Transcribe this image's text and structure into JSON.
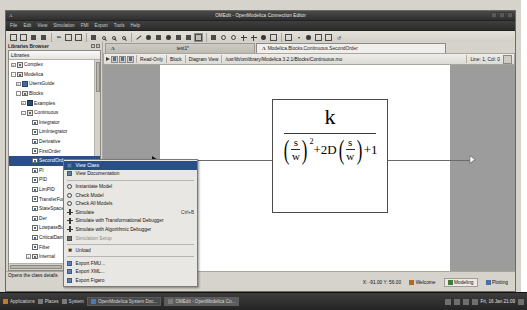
{
  "window": {
    "title": "OMEdit - OpenModelica Connection Editor",
    "app_icon": "A",
    "menus": [
      "File",
      "Edit",
      "View",
      "Simulation",
      "FMI",
      "Export",
      "Tools",
      "Help"
    ]
  },
  "toolbar": {
    "buttons": [
      {
        "name": "new-modelica-class",
        "glyph": "new"
      },
      {
        "name": "open-model",
        "glyph": "open"
      },
      {
        "name": "save",
        "glyph": "save"
      },
      {
        "name": "save-as",
        "glyph": "saveas"
      },
      {
        "name": "cut",
        "glyph": "cut"
      },
      {
        "name": "copy",
        "glyph": "copy"
      },
      {
        "name": "paste",
        "glyph": "paste"
      },
      {
        "name": "grid-lines",
        "glyph": "grid"
      },
      {
        "name": "zoom-reset",
        "glyph": "zoom"
      },
      {
        "name": "zoom-in",
        "glyph": "zoomin"
      },
      {
        "name": "zoom-out",
        "glyph": "zoomout"
      },
      {
        "name": "line-shape",
        "glyph": "line"
      },
      {
        "name": "polygon-shape",
        "glyph": "polygon"
      },
      {
        "name": "rectangle-shape",
        "glyph": "rect"
      },
      {
        "name": "ellipse-shape",
        "glyph": "ellipse"
      },
      {
        "name": "text-shape",
        "glyph": "text"
      },
      {
        "name": "bitmap-shape",
        "glyph": "bitmap"
      },
      {
        "name": "connect-mode",
        "glyph": "connect"
      },
      {
        "name": "check-model",
        "glyph": "check"
      },
      {
        "name": "instantiate-model",
        "glyph": "instantiate"
      },
      {
        "name": "simulate",
        "glyph": "simulate"
      },
      {
        "name": "simulate-transformational",
        "glyph": "simtrans"
      },
      {
        "name": "simulate-algorithmic",
        "glyph": "simalgo"
      },
      {
        "name": "simulation-setup",
        "glyph": "setup"
      },
      {
        "name": "new-plot-window",
        "glyph": "plot"
      },
      {
        "name": "plot-dropdown",
        "glyph": "dropdown"
      },
      {
        "name": "clear-plot",
        "glyph": "clear"
      },
      {
        "name": "grid-toggle",
        "glyph": "gridtoggle"
      },
      {
        "name": "log-view",
        "glyph": "log"
      },
      {
        "name": "rotate",
        "glyph": "rotate"
      }
    ]
  },
  "libraries_browser": {
    "dock_title": "Libraries Browser",
    "column_header": "Libraries",
    "tree": [
      {
        "label": "Complex",
        "depth": 0,
        "expander": "+",
        "icon": "pkg",
        "selected": false
      },
      {
        "label": "Modelica",
        "depth": 0,
        "expander": "-",
        "icon": "pkg",
        "selected": false
      },
      {
        "label": "UsersGuide",
        "depth": 1,
        "expander": "+",
        "icon": "blue",
        "selected": false
      },
      {
        "label": "Blocks",
        "depth": 1,
        "expander": "-",
        "icon": "pkg",
        "selected": false
      },
      {
        "label": "Examples",
        "depth": 2,
        "expander": "+",
        "icon": "mdl",
        "selected": false
      },
      {
        "label": "Continuous",
        "depth": 2,
        "expander": "-",
        "icon": "pkg",
        "selected": false
      },
      {
        "label": "Integrator",
        "depth": 3,
        "expander": "",
        "icon": "blk",
        "selected": false
      },
      {
        "label": "LimIntegrator",
        "depth": 3,
        "expander": "",
        "icon": "blk",
        "selected": false
      },
      {
        "label": "Derivative",
        "depth": 3,
        "expander": "",
        "icon": "blk",
        "selected": false
      },
      {
        "label": "FirstOrder",
        "depth": 3,
        "expander": "",
        "icon": "blk",
        "selected": false
      },
      {
        "label": "SecondOrder",
        "depth": 3,
        "expander": "",
        "icon": "blk",
        "selected": true
      },
      {
        "label": "PI",
        "depth": 3,
        "expander": "",
        "icon": "blk",
        "selected": false
      },
      {
        "label": "PID",
        "depth": 3,
        "expander": "",
        "icon": "blk",
        "selected": false
      },
      {
        "label": "LimPID",
        "depth": 3,
        "expander": "",
        "icon": "blk",
        "selected": false
      },
      {
        "label": "TransferFunction",
        "depth": 3,
        "expander": "",
        "icon": "blk",
        "selected": false
      },
      {
        "label": "StateSpace",
        "depth": 3,
        "expander": "",
        "icon": "blk",
        "selected": false
      },
      {
        "label": "Der",
        "depth": 3,
        "expander": "",
        "icon": "blk",
        "selected": false
      },
      {
        "label": "LowpassButterworth",
        "depth": 3,
        "expander": "",
        "icon": "blk",
        "selected": false
      },
      {
        "label": "CriticalDamping",
        "depth": 3,
        "expander": "",
        "icon": "blk",
        "selected": false
      },
      {
        "label": "Filter",
        "depth": 3,
        "expander": "",
        "icon": "blk",
        "selected": false
      },
      {
        "label": "Internal",
        "depth": 3,
        "expander": "+",
        "icon": "pkg",
        "selected": false
      },
      {
        "label": "Discrete",
        "depth": 2,
        "expander": "+",
        "icon": "pkg",
        "selected": false
      },
      {
        "label": "Interaction",
        "depth": 2,
        "expander": "+",
        "icon": "pkg",
        "selected": false
      },
      {
        "label": "Interfaces",
        "depth": 2,
        "expander": "+",
        "icon": "dk",
        "selected": false
      },
      {
        "label": "Logical",
        "depth": 2,
        "expander": "+",
        "icon": "pkg",
        "selected": false
      },
      {
        "label": "Math",
        "depth": 2,
        "expander": "+",
        "icon": "pkg",
        "selected": false
      }
    ]
  },
  "context_menu": {
    "items": [
      {
        "label": "View Class",
        "icon": "view-class-icon",
        "accel": "",
        "highlighted": true,
        "disabled": false,
        "separator_after": false
      },
      {
        "label": "View Documentation",
        "icon": "documentation-icon",
        "accel": "",
        "highlighted": false,
        "disabled": false,
        "separator_after": true
      },
      {
        "label": "Instantiate Model",
        "icon": "instantiate-icon",
        "accel": "",
        "highlighted": false,
        "disabled": false,
        "separator_after": false
      },
      {
        "label": "Check Model",
        "icon": "check-model-icon",
        "accel": "",
        "highlighted": false,
        "disabled": false,
        "separator_after": false
      },
      {
        "label": "Check All Models",
        "icon": "check-all-icon",
        "accel": "",
        "highlighted": false,
        "disabled": false,
        "separator_after": false
      },
      {
        "label": "Simulate",
        "icon": "simulate-icon",
        "accel": "Ctrl+B",
        "highlighted": false,
        "disabled": false,
        "separator_after": false
      },
      {
        "label": "Simulate with Transformational Debugger",
        "icon": "sim-transform-icon",
        "accel": "",
        "highlighted": false,
        "disabled": false,
        "separator_after": false
      },
      {
        "label": "Simulate with Algorithmic Debugger",
        "icon": "sim-algorithmic-icon",
        "accel": "",
        "highlighted": false,
        "disabled": false,
        "separator_after": false
      },
      {
        "label": "Simulation Setup",
        "icon": "simulation-setup-icon",
        "accel": "",
        "highlighted": false,
        "disabled": true,
        "separator_after": true
      },
      {
        "label": "Unload",
        "icon": "unload-icon",
        "accel": "",
        "highlighted": false,
        "disabled": false,
        "separator_after": true
      },
      {
        "label": "Export FMU...",
        "icon": "export-fmu-icon",
        "accel": "",
        "highlighted": false,
        "disabled": false,
        "separator_after": false
      },
      {
        "label": "Export XML...",
        "icon": "export-xml-icon",
        "accel": "",
        "highlighted": false,
        "disabled": false,
        "separator_after": false
      },
      {
        "label": "Export Figaro",
        "icon": "export-figaro-icon",
        "accel": "",
        "highlighted": false,
        "disabled": false,
        "separator_after": false
      }
    ]
  },
  "tabs": [
    {
      "label": "test1*",
      "active": false
    },
    {
      "label": "Modelica.Blocks.Continuous.SecondOrder",
      "active": true
    }
  ],
  "document_toolbar": {
    "readonly_label": "Read-Only",
    "restriction_label": "Block",
    "view_label": "Diagram View",
    "path": "/usr/lib/omlibrary/Modelica 3.2.1/Blocks/Continuous.mo",
    "line_col": "Line: 1, Col: 0"
  },
  "diagram": {
    "block_label": "SecondOrder",
    "numerator": "k",
    "denominator": {
      "term1_num": "s",
      "term1_den": "w",
      "exponent": "2",
      "middle": "+2D",
      "term2_num": "s",
      "term2_den": "w",
      "tail": "+1"
    }
  },
  "status_bar": {
    "hint": "Opens the class details",
    "coordinates": "X: -91.00  Y: 56.00",
    "perspectives": [
      {
        "label": "Welcome",
        "icon": "welcome-icon",
        "active": false
      },
      {
        "label": "Modeling",
        "icon": "modeling-icon",
        "active": true
      },
      {
        "label": "Plotting",
        "icon": "plotting-icon",
        "active": false
      }
    ]
  },
  "taskbar": {
    "menus": [
      "Applications",
      "Places",
      "System"
    ],
    "windows": [
      {
        "label": "OpenModelica System Doc...",
        "active": false
      },
      {
        "label": "OMEdit - OpenModelica Co...",
        "active": true
      }
    ],
    "clock": "Fri, 16 Jan  21:09"
  }
}
